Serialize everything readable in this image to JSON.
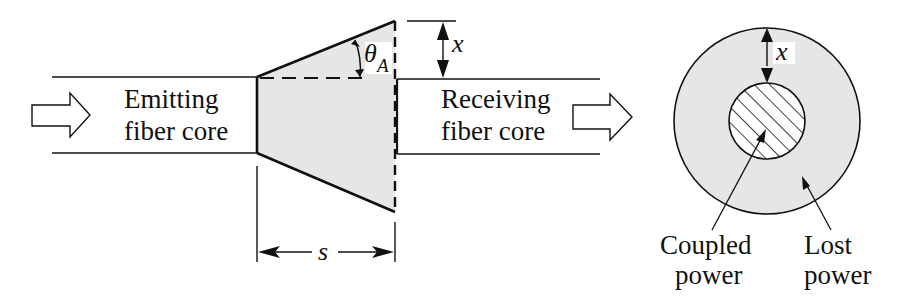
{
  "figure": {
    "left_panel": {
      "emitting_label": [
        "Emitting",
        "fiber core"
      ],
      "receiving_label": [
        "Receiving",
        "fiber core"
      ],
      "angle_symbol": "θ",
      "angle_subscript": "A",
      "offset_symbol": "x",
      "separation_symbol": "s"
    },
    "right_panel": {
      "offset_symbol": "x",
      "coupled_label": [
        "Coupled",
        "power"
      ],
      "lost_label": [
        "Lost",
        "power"
      ]
    },
    "colors": {
      "line": "#111111",
      "cone_fill": "#e6e6e6",
      "lost_fill": "#e6e6e6",
      "background": "#ffffff"
    }
  }
}
